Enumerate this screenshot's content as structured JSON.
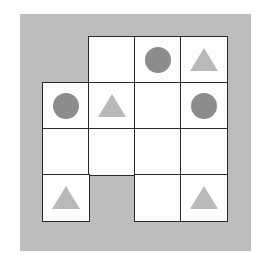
{
  "diagram": {
    "type": "grid-puzzle",
    "rows": 4,
    "cols": 4,
    "colors": {
      "background": "#bdbdbd",
      "cell": "#fdfdfd",
      "border": "#2a2a2a",
      "circle": "#8c8c8c",
      "triangle": "#b9b9b9"
    },
    "cells": [
      {
        "row": 0,
        "col": 1,
        "shape": "empty"
      },
      {
        "row": 0,
        "col": 2,
        "shape": "circle"
      },
      {
        "row": 0,
        "col": 3,
        "shape": "triangle"
      },
      {
        "row": 1,
        "col": 0,
        "shape": "circle"
      },
      {
        "row": 1,
        "col": 1,
        "shape": "triangle"
      },
      {
        "row": 1,
        "col": 2,
        "shape": "empty"
      },
      {
        "row": 1,
        "col": 3,
        "shape": "circle"
      },
      {
        "row": 2,
        "col": 0,
        "shape": "empty"
      },
      {
        "row": 2,
        "col": 1,
        "shape": "empty"
      },
      {
        "row": 2,
        "col": 2,
        "shape": "empty"
      },
      {
        "row": 2,
        "col": 3,
        "shape": "empty"
      },
      {
        "row": 3,
        "col": 0,
        "shape": "triangle"
      },
      {
        "row": 3,
        "col": 2,
        "shape": "empty"
      },
      {
        "row": 3,
        "col": 3,
        "shape": "triangle"
      }
    ]
  }
}
